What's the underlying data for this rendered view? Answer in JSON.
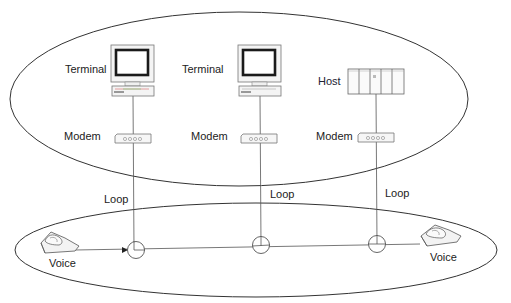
{
  "diagram": {
    "title": "",
    "upper_region": {
      "nodes": [
        {
          "id": "terminal-1",
          "type": "terminal",
          "label": "Terminal",
          "modem_label": "Modem",
          "loop_label": "Loop"
        },
        {
          "id": "terminal-2",
          "type": "terminal",
          "label": "Terminal",
          "modem_label": "Modem",
          "loop_label": "Loop"
        },
        {
          "id": "host",
          "type": "host",
          "label": "Host",
          "modem_label": "Modem",
          "loop_label": "Loop"
        }
      ]
    },
    "lower_region": {
      "voice_left": {
        "label": "Voice",
        "icon": "telephone-icon"
      },
      "voice_right": {
        "label": "Voice",
        "icon": "telephone-icon"
      },
      "junctions": 3
    },
    "icons": {
      "terminal": "monitor-icon",
      "host": "server-rack-icon",
      "modem": "modem-icon",
      "voice": "telephone-icon",
      "junction": "circle-junction-icon"
    },
    "colors": {
      "line": "#444444",
      "text": "#222222",
      "screen": "#1a1a1a"
    }
  }
}
